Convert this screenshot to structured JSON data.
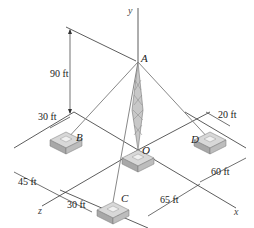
{
  "diagram": {
    "axes": {
      "x": "x",
      "y": "y",
      "z": "z"
    },
    "points": {
      "A": "A",
      "B": "B",
      "C": "C",
      "D": "D",
      "O": "O"
    },
    "dimensions": {
      "height": "90 ft",
      "b_offset_left": "30 ft",
      "d_offset": "20 ft",
      "z_45": "45 ft",
      "c_offset": "30 ft",
      "x_65": "65 ft",
      "x_60": "60 ft"
    },
    "colors": {
      "line": "#333333",
      "cable": "#888888",
      "footing": "#b0b0b0",
      "tower": "#9a9a9a"
    }
  }
}
